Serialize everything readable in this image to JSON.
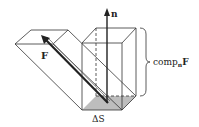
{
  "diagram": {
    "labels": {
      "normal": "n",
      "force": "F",
      "area": "ΔS",
      "component": "comp",
      "component_sub": "n",
      "component_vec": "F"
    },
    "colors": {
      "stroke": "#333333",
      "shade": "#b8b8b8",
      "arrow": "#222222"
    }
  }
}
